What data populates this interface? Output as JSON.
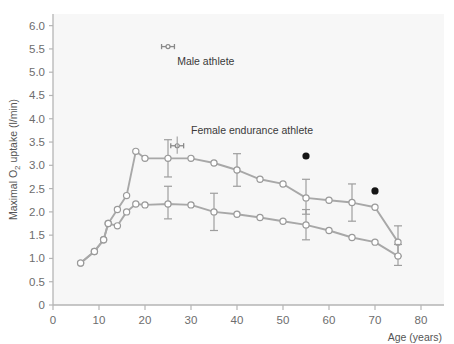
{
  "chart_data": {
    "type": "line",
    "title": "",
    "subtitle": "",
    "xlabel": "Age (years)",
    "ylabel": "Maximal O2 uptake (l/min)",
    "ylabel_parts": {
      "pre": "Maximal O",
      "sub": "2",
      "post": " uptake (l/min)"
    },
    "xlim": [
      0,
      85
    ],
    "ylim": [
      0,
      6.25
    ],
    "xticks": [
      0,
      10,
      20,
      30,
      40,
      50,
      60,
      70,
      80
    ],
    "xticklabels": [
      "0",
      "10",
      "20",
      "30",
      "40",
      "50",
      "60",
      "70",
      "80"
    ],
    "yticks": [
      0,
      0.5,
      1.0,
      1.5,
      2.0,
      2.5,
      3.0,
      3.5,
      4.0,
      4.5,
      5.0,
      5.5,
      6.0
    ],
    "yticklabels": [
      "0",
      "0.5",
      "1.0",
      "1.5",
      "2.0",
      "2.5",
      "3.0",
      "3.5",
      "4.0",
      "4.5",
      "5.0",
      "5.5",
      "6.0"
    ],
    "grid": false,
    "legend_position": "inline-annotation",
    "series": [
      {
        "name": "Female endurance athlete",
        "marker": "open-circle",
        "color": "#a8a8a8",
        "x": [
          6,
          9,
          11,
          12,
          14,
          16,
          18,
          20,
          25,
          30,
          35,
          40,
          45,
          50,
          55,
          60,
          65,
          70,
          75
        ],
        "y": [
          0.9,
          1.15,
          1.4,
          1.75,
          2.05,
          2.35,
          3.3,
          3.15,
          3.15,
          3.15,
          3.05,
          2.9,
          2.7,
          2.6,
          2.3,
          2.25,
          2.2,
          2.1,
          1.35
        ],
        "errorbars": [
          {
            "x": 25,
            "y": 3.15,
            "lower": 2.75,
            "upper": 3.55
          },
          {
            "x": 40,
            "y": 2.9,
            "lower": 2.55,
            "upper": 3.25
          },
          {
            "x": 55,
            "y": 2.3,
            "lower": 1.95,
            "upper": 2.7
          },
          {
            "x": 65,
            "y": 2.2,
            "lower": 1.8,
            "upper": 2.6
          },
          {
            "x": 75,
            "y": 1.35,
            "lower": 1.05,
            "upper": 1.7
          }
        ]
      },
      {
        "name": "Sedentary",
        "marker": "open-circle",
        "color": "#a8a8a8",
        "x": [
          6,
          9,
          11,
          12,
          14,
          16,
          18,
          20,
          25,
          30,
          35,
          40,
          45,
          50,
          55,
          60,
          65,
          70,
          75
        ],
        "y": [
          0.9,
          1.15,
          1.4,
          1.75,
          1.7,
          2.0,
          2.17,
          2.15,
          2.17,
          2.15,
          2.0,
          1.95,
          1.88,
          1.8,
          1.72,
          1.6,
          1.45,
          1.35,
          1.05
        ],
        "errorbars": [
          {
            "x": 25,
            "y": 2.17,
            "lower": 1.85,
            "upper": 2.55
          },
          {
            "x": 35,
            "y": 2.0,
            "lower": 1.6,
            "upper": 2.4
          },
          {
            "x": 55,
            "y": 1.72,
            "lower": 1.4,
            "upper": 2.05
          },
          {
            "x": 75,
            "y": 1.05,
            "lower": 0.85,
            "upper": 1.3
          }
        ]
      }
    ],
    "scatter_points": [
      {
        "x": 55,
        "y": 3.2,
        "marker": "filled-circle",
        "color": "#151515"
      },
      {
        "x": 70,
        "y": 2.45,
        "marker": "filled-circle",
        "color": "#151515"
      }
    ],
    "annotations": [
      {
        "name": "male-athlete",
        "label": "Male athlete",
        "marker_x": 25,
        "marker_y": 5.55,
        "marker_err_lower": 5.55,
        "marker_err_upper": 5.55,
        "marker_halfwidth": 1.4,
        "label_x": 27,
        "label_y": 5.25
      },
      {
        "name": "female-endurance-athlete",
        "label": "Female endurance athlete",
        "marker_x": 27,
        "marker_y": 3.42,
        "marker_err_lower": 3.25,
        "marker_err_upper": 3.62,
        "marker_halfwidth": 1.4,
        "label_x": 30,
        "label_y": 3.75
      }
    ],
    "colors": {
      "line": "#a8a8a8",
      "marker_fill": "#ffffff",
      "marker_stroke": "#9a9a9a",
      "axis": "#b5b5b5",
      "tick_text": "#6d6d6d",
      "plot_background": "#f7f7f7",
      "figure_background": "#ffffff",
      "scatter": "#151515",
      "annotation_text": "#3a3a3a"
    }
  }
}
